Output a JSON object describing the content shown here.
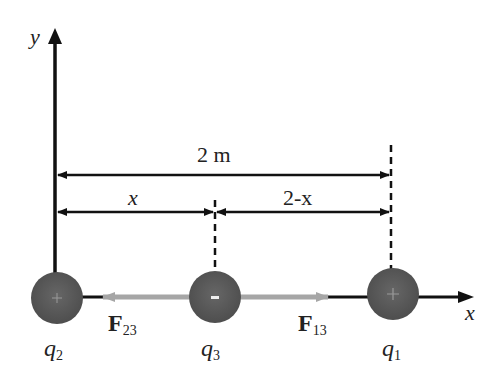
{
  "diagram": {
    "axes": {
      "x_label": "x",
      "y_label": "y"
    },
    "dimensions": {
      "total": "2 m",
      "left": "x",
      "right": "2-x"
    },
    "charges": [
      {
        "name": "q",
        "sub": "2",
        "sign": "+"
      },
      {
        "name": "q",
        "sub": "3",
        "sign": "-"
      },
      {
        "name": "q",
        "sub": "1",
        "sign": "+"
      }
    ],
    "forces": [
      {
        "name": "F",
        "sub": "23"
      },
      {
        "name": "F",
        "sub": "13"
      }
    ],
    "colors": {
      "charge": "#5b5b5b",
      "force_arrow": "#a6a6a6",
      "line": "#111111"
    }
  }
}
